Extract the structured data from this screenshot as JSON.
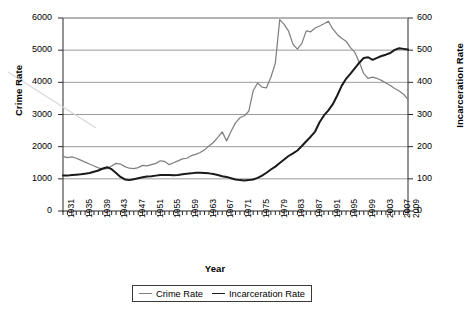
{
  "chart_data": {
    "type": "line",
    "title": "",
    "xlabel": "Year",
    "ylabel": "Crime Rate",
    "y2label": "Incarceration Rate",
    "ylim": [
      0,
      6000
    ],
    "y2lim": [
      0,
      600
    ],
    "xlim": [
      1931,
      2009
    ],
    "grid": true,
    "legend_position": "bottom-center",
    "y_ticks": [
      "0",
      "1000",
      "2000",
      "3000",
      "4000",
      "5000",
      "6000"
    ],
    "y2_ticks": [
      "0",
      "100",
      "200",
      "300",
      "400",
      "500",
      "600"
    ],
    "x_tick_labels": [
      "1931",
      "1935",
      "1939",
      "1943",
      "1947",
      "1951",
      "1955",
      "1959",
      "1963",
      "1967",
      "1971",
      "1975",
      "1979",
      "1983",
      "1987",
      "1991",
      "1995",
      "1999",
      "2003",
      "2007",
      "2009"
    ],
    "x": [
      1931,
      1932,
      1933,
      1934,
      1935,
      1936,
      1937,
      1938,
      1939,
      1940,
      1941,
      1942,
      1943,
      1944,
      1945,
      1946,
      1947,
      1948,
      1949,
      1950,
      1951,
      1952,
      1953,
      1954,
      1955,
      1956,
      1957,
      1958,
      1959,
      1960,
      1961,
      1962,
      1963,
      1964,
      1965,
      1966,
      1967,
      1968,
      1969,
      1970,
      1971,
      1972,
      1973,
      1974,
      1975,
      1976,
      1977,
      1978,
      1979,
      1980,
      1981,
      1982,
      1983,
      1984,
      1985,
      1986,
      1987,
      1988,
      1989,
      1990,
      1991,
      1992,
      1993,
      1994,
      1995,
      1996,
      1997,
      1998,
      1999,
      2000,
      2001,
      2002,
      2003,
      2004,
      2005,
      2006,
      2007,
      2008,
      2009
    ],
    "series": [
      {
        "name": "Crime Rate",
        "axis": "left",
        "color": "#808080",
        "values": [
          1700,
          1660,
          1680,
          1640,
          1580,
          1520,
          1460,
          1400,
          1340,
          1300,
          1320,
          1400,
          1480,
          1460,
          1380,
          1330,
          1320,
          1350,
          1420,
          1400,
          1440,
          1480,
          1560,
          1540,
          1440,
          1500,
          1560,
          1620,
          1640,
          1720,
          1760,
          1820,
          1900,
          2020,
          2130,
          2290,
          2460,
          2180,
          2480,
          2740,
          2900,
          2960,
          3100,
          3740,
          3980,
          3850,
          3830,
          4160,
          4590,
          5950,
          5800,
          5590,
          5180,
          5030,
          5210,
          5600,
          5570,
          5690,
          5750,
          5820,
          5900,
          5660,
          5490,
          5370,
          5280,
          5080,
          4930,
          4620,
          4270,
          4120,
          4160,
          4120,
          4060,
          3980,
          3900,
          3810,
          3730,
          3630,
          3470
        ]
      },
      {
        "name": "Incarceration Rate",
        "axis": "right",
        "color": "#1a1a1a",
        "values": [
          110,
          110,
          112,
          113,
          114,
          116,
          118,
          122,
          126,
          132,
          136,
          130,
          118,
          106,
          98,
          96,
          99,
          102,
          105,
          107,
          108,
          110,
          112,
          112,
          112,
          111,
          112,
          114,
          116,
          117,
          119,
          119,
          118,
          117,
          115,
          112,
          108,
          106,
          102,
          98,
          96,
          95,
          96,
          98,
          103,
          110,
          119,
          129,
          138,
          149,
          160,
          171,
          179,
          188,
          202,
          217,
          231,
          247,
          276,
          297,
          313,
          332,
          359,
          389,
          411,
          427,
          444,
          461,
          476,
          478,
          470,
          476,
          482,
          486,
          491,
          501,
          506,
          504,
          502
        ]
      }
    ]
  },
  "legend": {
    "items": [
      {
        "label": "Crime Rate",
        "color": "#808080"
      },
      {
        "label": "Incarceration Rate",
        "color": "#1a1a1a"
      }
    ]
  },
  "axes": {
    "left_title": "Crime Rate",
    "right_title": "Incarceration Rate",
    "bottom_title": "Year"
  }
}
